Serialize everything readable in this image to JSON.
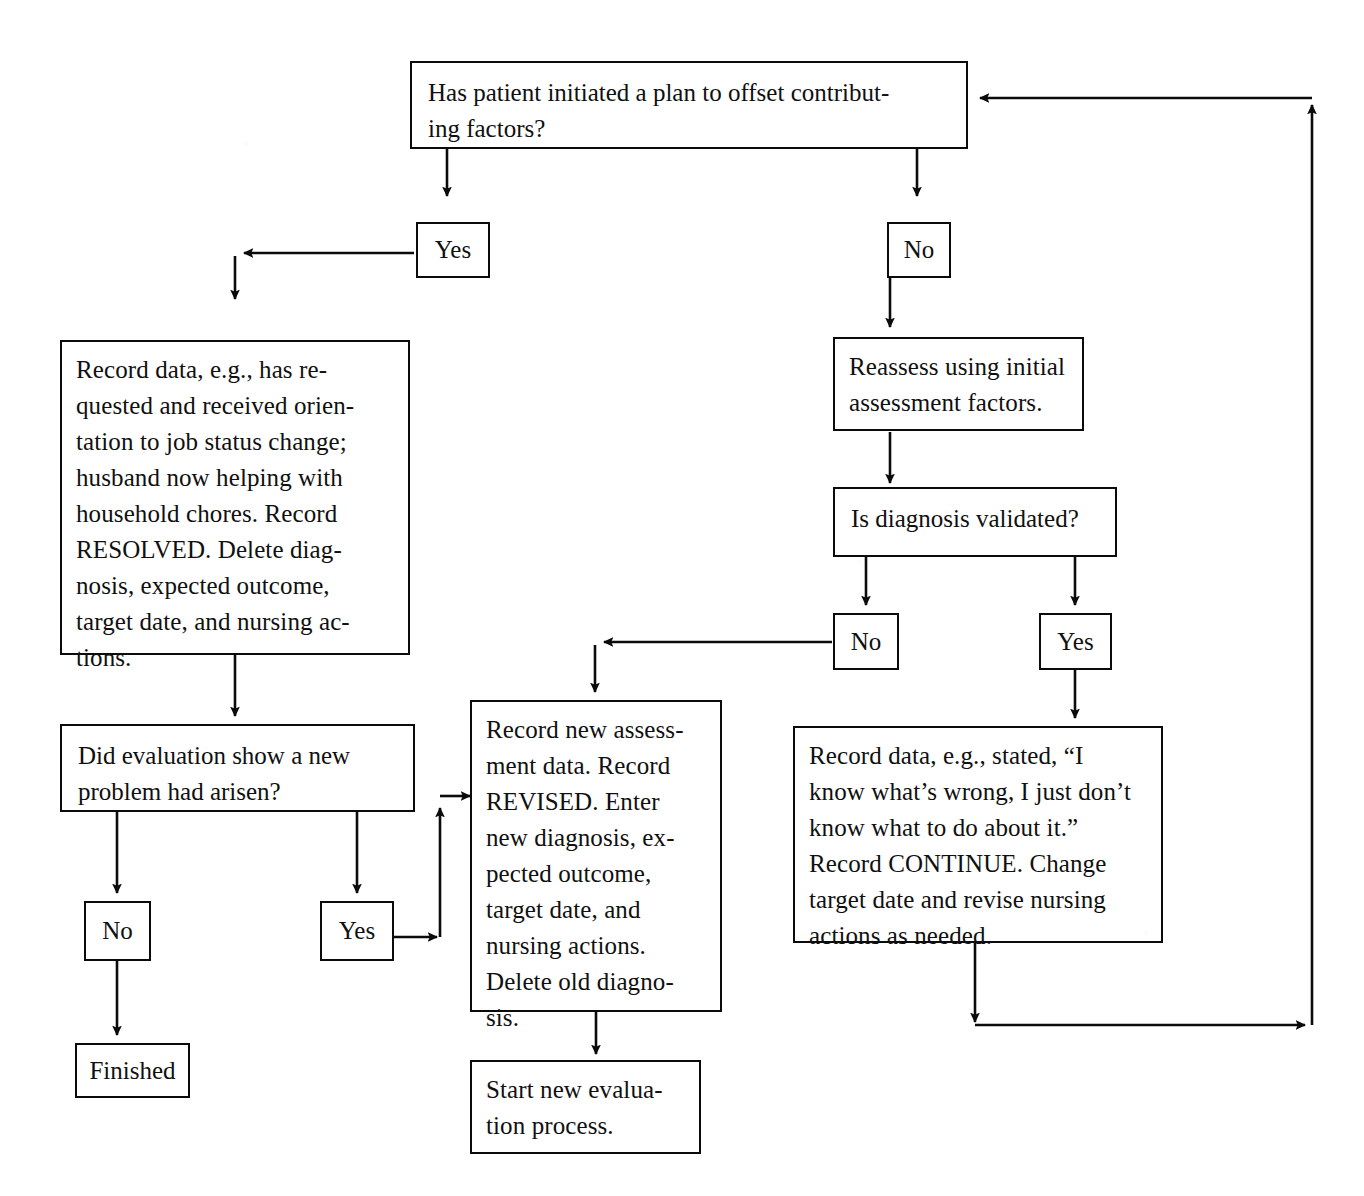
{
  "diagram": {
    "line_color": "#0b0b0b",
    "box_fill": "#ffffff",
    "background": "#ffffff"
  },
  "nodes": {
    "q_initiated_plan": {
      "label": "Has patient initiated a plan to offset contribut-\ning factors?",
      "kind": "question"
    },
    "yes_top": {
      "label": "Yes",
      "kind": "label"
    },
    "no_top": {
      "label": "No",
      "kind": "label"
    },
    "resolved_record": {
      "label": "Record data, e.g., has re-\nquested and received orien-\ntation to job status change;\nhusband now helping with\nhousehold chores. Record\nRESOLVED. Delete diag-\nnosis, expected outcome,\ntarget date, and nursing ac-\ntions.",
      "kind": "process"
    },
    "reassess": {
      "label": "Reassess using initial\nassessment factors.",
      "kind": "process"
    },
    "q_diagnosis_validated": {
      "label": "Is diagnosis validated?",
      "kind": "question"
    },
    "no_mid": {
      "label": "No",
      "kind": "label"
    },
    "yes_mid": {
      "label": "Yes",
      "kind": "label"
    },
    "q_new_problem": {
      "label": "Did evaluation show a new\nproblem had arisen?",
      "kind": "question"
    },
    "no_bottom": {
      "label": "No",
      "kind": "label"
    },
    "yes_bottom": {
      "label": "Yes",
      "kind": "label"
    },
    "revised_record": {
      "label": "Record new assess-\nment data. Record\nREVISED. Enter\nnew diagnosis, ex-\npected outcome,\ntarget date, and\nnursing actions.\nDelete old diagno-\nsis.",
      "kind": "process"
    },
    "continue_record": {
      "label": "Record data, e.g., stated, “I\nknow what’s wrong, I just don’t\nknow what to do about  it.”\nRecord CONTINUE. Change\ntarget date and revise nursing\nactions as needed.",
      "kind": "process"
    },
    "finished": {
      "label": "Finished",
      "kind": "terminal"
    },
    "start_new_evaluation": {
      "label": "Start new evalua-\ntion process.",
      "kind": "process"
    }
  },
  "edges": [
    {
      "from": "q_initiated_plan",
      "to": "yes_top",
      "label": ""
    },
    {
      "from": "q_initiated_plan",
      "to": "no_top",
      "label": ""
    },
    {
      "from": "yes_top",
      "to": "resolved_record",
      "label": ""
    },
    {
      "from": "no_top",
      "to": "reassess",
      "label": ""
    },
    {
      "from": "reassess",
      "to": "q_diagnosis_validated",
      "label": ""
    },
    {
      "from": "q_diagnosis_validated",
      "to": "no_mid",
      "label": ""
    },
    {
      "from": "q_diagnosis_validated",
      "to": "yes_mid",
      "label": ""
    },
    {
      "from": "no_mid",
      "to": "revised_record",
      "label": ""
    },
    {
      "from": "yes_mid",
      "to": "continue_record",
      "label": ""
    },
    {
      "from": "resolved_record",
      "to": "q_new_problem",
      "label": ""
    },
    {
      "from": "q_new_problem",
      "to": "no_bottom",
      "label": ""
    },
    {
      "from": "q_new_problem",
      "to": "yes_bottom",
      "label": ""
    },
    {
      "from": "no_bottom",
      "to": "finished",
      "label": ""
    },
    {
      "from": "yes_bottom",
      "to": "revised_record",
      "label": ""
    },
    {
      "from": "revised_record",
      "to": "start_new_evaluation",
      "label": ""
    },
    {
      "from": "continue_record",
      "to": "q_initiated_plan",
      "label": ""
    }
  ]
}
